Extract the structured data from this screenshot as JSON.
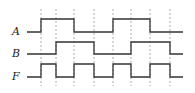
{
  "diagram": {
    "type": "timing-diagram",
    "colors": {
      "signal": "#333333",
      "grid": "#999999",
      "background": "#ffffff"
    },
    "time_marks_x": [
      41,
      56,
      74,
      94,
      113,
      131,
      150,
      170
    ],
    "x_start": 27,
    "x_end": 183,
    "grid_top": 9,
    "grid_bottom": 86,
    "signals": [
      {
        "name": "A",
        "label_x": 12,
        "high_y": 19,
        "low_y": 32,
        "initial": 0,
        "edges": [
          41,
          74,
          113,
          150
        ]
      },
      {
        "name": "B",
        "label_x": 12,
        "high_y": 42,
        "low_y": 54,
        "initial": 0,
        "edges": [
          56,
          94,
          131,
          170
        ]
      },
      {
        "name": "F",
        "label_x": 12,
        "high_y": 64,
        "low_y": 77,
        "initial": 0,
        "edges": [
          41,
          56,
          74,
          94,
          113,
          131,
          150,
          170
        ]
      }
    ]
  }
}
